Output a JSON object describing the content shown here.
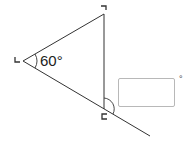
{
  "diagram": {
    "type": "triangle-exterior-angle",
    "vertices": {
      "top": {
        "x": 104,
        "y": 14,
        "mark": "right-angle-marker-top"
      },
      "left": {
        "x": 23,
        "y": 61,
        "mark": "corner-marker-left"
      },
      "bottom": {
        "x": 104,
        "y": 109,
        "mark": "corner-marker-bottom"
      }
    },
    "extension_end": {
      "x": 150,
      "y": 136
    },
    "known_angle": {
      "label": "60°",
      "vertex": "left"
    },
    "unknown_angle": {
      "vertex": "bottom",
      "description": "exterior angle between vertical side and extended base"
    },
    "line_color": "#333333"
  },
  "answer": {
    "value": "",
    "placeholder": "",
    "suffix": "°"
  }
}
